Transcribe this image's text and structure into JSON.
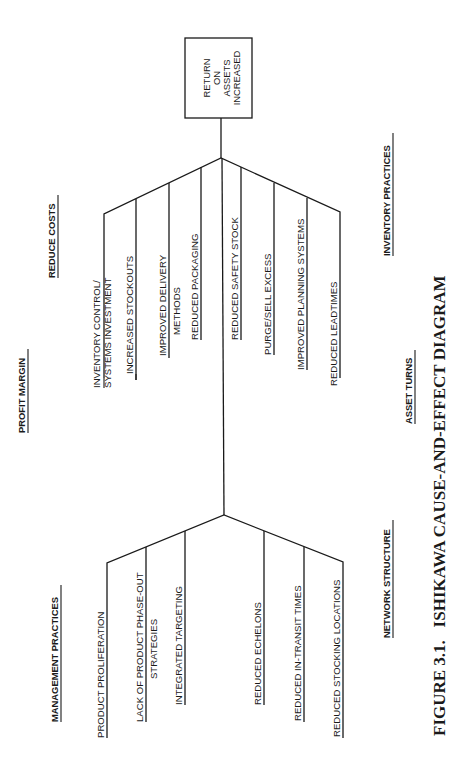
{
  "effect_box": {
    "lines": [
      "RETURN",
      "ON",
      "ASSETS",
      "INCREASED"
    ]
  },
  "categories": {
    "reduce_costs": "REDUCE COSTS",
    "profit_margin": "PROFIT MARGIN",
    "management_practices": "MANAGEMENT PRACTICES",
    "inventory_practices": "INVENTORY PRACTICES",
    "asset_turns": "ASSET TURNS",
    "network_structure": "NETWORK STRUCTURE"
  },
  "upper_fork_left": [
    {
      "lines": [
        "INVENTORY CONTROL/",
        "SYSTEMS INVESTMENT"
      ]
    },
    {
      "lines": [
        "INCREASED STOCKOUTS"
      ]
    },
    {
      "lines": [
        "IMPROVED DELIVERY",
        "METHODS"
      ]
    },
    {
      "lines": [
        "REDUCED PACKAGING"
      ]
    }
  ],
  "upper_fork_right": [
    {
      "lines": [
        "REDUCED SAFETY STOCK"
      ]
    },
    {
      "lines": [
        "PURGE/SELL EXCESS"
      ]
    },
    {
      "lines": [
        "IMPROVED PLANNING SYSTEMS"
      ]
    },
    {
      "lines": [
        "REDUCED LEADTIMES"
      ]
    }
  ],
  "lower_fork_left": [
    {
      "lines": [
        "PRODUCT PROLIFERATION"
      ]
    },
    {
      "lines": [
        "LACK OF PRODUCT PHASE-OUT",
        "STRATEGIES"
      ]
    },
    {
      "lines": [
        "INTEGRATED TARGETING"
      ]
    }
  ],
  "lower_fork_right": [
    {
      "lines": [
        "REDUCED ECHELONS"
      ]
    },
    {
      "lines": [
        "REDUCED IN-TRANSIT TIMES"
      ]
    },
    {
      "lines": [
        "REDUCED STOCKING LOCATIONS"
      ]
    }
  ],
  "caption": "FIGURE 3.1.   ISHIKAWA CAUSE-AND-EFFECT DIAGRAM"
}
